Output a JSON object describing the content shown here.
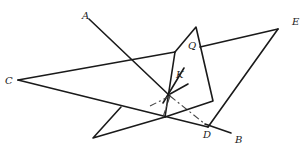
{
  "figure": {
    "type": "geometry-diagram",
    "labels": {
      "A": "A",
      "B": "B",
      "C": "C",
      "D": "D",
      "E": "E",
      "Q": "Q",
      "K": "K"
    },
    "colors": {
      "line": "#1a1a1a",
      "dashed": "#444444",
      "background": "#ffffff"
    }
  }
}
